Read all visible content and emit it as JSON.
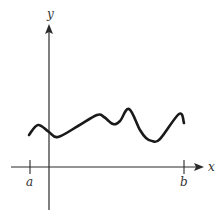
{
  "diagram": {
    "type": "function-graph",
    "axes": {
      "x_label": "x",
      "y_label": "y"
    },
    "interval": {
      "start_label": "a",
      "end_label": "b"
    },
    "colors": {
      "curve": "#1a1a1a",
      "axes": "#2a2a2a",
      "background": "#ffffff"
    },
    "curve_points": [
      [
        29,
        135
      ],
      [
        38,
        125
      ],
      [
        49,
        132
      ],
      [
        58,
        137
      ],
      [
        78,
        126
      ],
      [
        97,
        115
      ],
      [
        104,
        117
      ],
      [
        113,
        124
      ],
      [
        120,
        121
      ],
      [
        129,
        109
      ],
      [
        140,
        130
      ],
      [
        146,
        138
      ],
      [
        152,
        141
      ],
      [
        160,
        139
      ],
      [
        179,
        114
      ],
      [
        184,
        123
      ]
    ]
  }
}
